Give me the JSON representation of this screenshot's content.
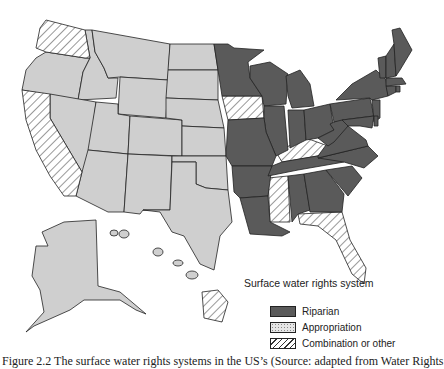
{
  "legend": {
    "title": "Surface water rights system",
    "items": [
      {
        "label": "Riparian",
        "pattern": "riparian",
        "color": "#5a5a5a"
      },
      {
        "label": "Appropriation",
        "pattern": "appropriation",
        "color": "#cfcfcf"
      },
      {
        "label": "Combination or other",
        "pattern": "combination",
        "color": "#ffffff"
      }
    ]
  },
  "caption": "Figure 2.2   The surface water rights systems in the US’s (Source: adapted from Water Rights",
  "map": {
    "colors": {
      "riparian": "#5a5a5a",
      "appropriation": "#cfcfcf",
      "combination": "#ffffff",
      "border": "#222222"
    },
    "states": {
      "riparian": [
        "MN",
        "WI",
        "MI",
        "IL",
        "IN",
        "OH",
        "MO",
        "AR",
        "LA",
        "TN",
        "AL",
        "GA",
        "SC",
        "NC",
        "VA",
        "WV",
        "PA",
        "NY",
        "NJ",
        "DE",
        "MD",
        "CT",
        "RI",
        "MA",
        "VT",
        "NH",
        "ME"
      ],
      "appropriation": [
        "OR",
        "ID",
        "MT",
        "WY",
        "NV",
        "UT",
        "CO",
        "AZ",
        "NM",
        "ND",
        "SD",
        "NE",
        "KS",
        "OK",
        "TX",
        "AK"
      ],
      "combination": [
        "WA",
        "CA",
        "IA",
        "KY",
        "MS",
        "FL",
        "HI"
      ]
    }
  }
}
